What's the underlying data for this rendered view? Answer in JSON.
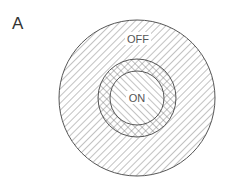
{
  "panel_label": "A",
  "regions": {
    "surround": {
      "label": "OFF"
    },
    "center": {
      "label": "ON"
    }
  },
  "colors": {
    "line": "#555555",
    "background": "#ffffff"
  }
}
